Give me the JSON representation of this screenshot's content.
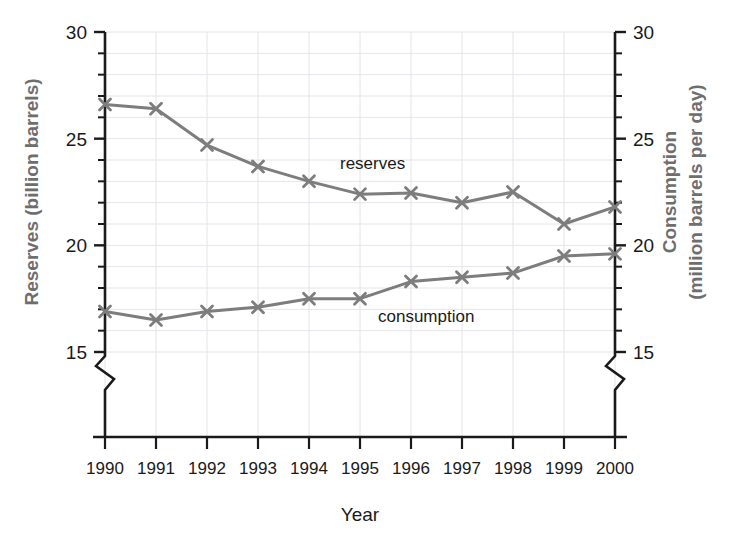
{
  "chart_data": {
    "type": "line",
    "title": "",
    "xlabel": "Year",
    "categories": [
      "1990",
      "1991",
      "1992",
      "1993",
      "1994",
      "1995",
      "1996",
      "1997",
      "1998",
      "1999",
      "2000"
    ],
    "grid": true,
    "legend_position": "inline-annotation",
    "axes": {
      "left": {
        "label": "Reserves (billion barrels)",
        "ticks": [
          "30",
          "25",
          "20",
          "15"
        ],
        "tick_values": [
          30,
          25,
          20,
          15
        ],
        "range": [
          15,
          30
        ],
        "minor_tick_step": 1,
        "broken": true,
        "break_note": "axis break below 15"
      },
      "right": {
        "label_line1": "Consumption",
        "label_line2": "(million barrels per day)",
        "label": "Consumption (million barrels per day)",
        "ticks": [
          "30",
          "25",
          "20",
          "15"
        ],
        "tick_values": [
          30,
          25,
          20,
          15
        ],
        "range": [
          15,
          30
        ],
        "minor_tick_step": 1,
        "broken": true
      }
    },
    "series": [
      {
        "name": "reserves",
        "label": "reserves",
        "axis": "left",
        "unit": "billion barrels",
        "color": "#7d7d7d",
        "marker": "x",
        "values": [
          26.6,
          26.4,
          24.7,
          23.7,
          23.0,
          22.4,
          22.45,
          22.0,
          22.5,
          21.0,
          21.8
        ]
      },
      {
        "name": "consumption",
        "label": "consumption",
        "axis": "right",
        "unit": "million barrels per day",
        "color": "#7d7d7d",
        "marker": "x",
        "values": [
          16.9,
          16.5,
          16.9,
          17.1,
          17.5,
          17.5,
          18.3,
          18.5,
          18.7,
          19.5,
          19.6
        ]
      }
    ],
    "colors": {
      "line": "#7d7d7d",
      "grid": "#e4e4ea",
      "axis": "#1a1a1a",
      "axis_title_left": "#6e6e6e",
      "axis_title_right": "#6e6e6e",
      "text": "#1a1a1a"
    }
  }
}
